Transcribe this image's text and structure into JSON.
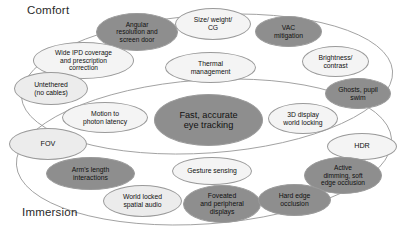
{
  "diagram": {
    "groups": [
      {
        "id": "comfort",
        "label": "Comfort"
      },
      {
        "id": "immersion",
        "label": "Immersion"
      }
    ],
    "colors": {
      "dark_fill": "#8e8e8e",
      "mid_fill": "#dcdcdc",
      "light_fill": "#ececec",
      "pale_fill": "#f4f4f4",
      "outline": "#9a9a9a",
      "text": "#111111",
      "background": "#ffffff"
    },
    "nodes": [
      {
        "id": "angular-resolution-and-screen-door",
        "label": "Angular resolution and screen door",
        "lines": [
          "Angular",
          "resolution and",
          "screen door"
        ],
        "group": "comfort",
        "shade": "dark",
        "x": 96,
        "y": 13,
        "w": 82,
        "h": 38,
        "font": 6.6
      },
      {
        "id": "size-weight-cg",
        "label": "Size/ weight/ CG",
        "lines": [
          "Size/ weight/",
          "CG"
        ],
        "group": "comfort",
        "shade": "pale",
        "x": 175,
        "y": 8,
        "w": 76,
        "h": 32,
        "font": 6.8
      },
      {
        "id": "vac-mitigation",
        "label": "VAC mitigation",
        "lines": [
          "VAC",
          "mitigation"
        ],
        "group": "comfort",
        "shade": "dark",
        "x": 255,
        "y": 16,
        "w": 67,
        "h": 31,
        "font": 6.8
      },
      {
        "id": "wide-ipd-coverage-and-prescription-correction",
        "label": "Wide IPD coverage and prescription correction",
        "lines": [
          "Wide IPD coverage",
          "and prescription",
          "correction"
        ],
        "group": "comfort",
        "shade": "pale",
        "x": 33,
        "y": 42,
        "w": 101,
        "h": 37,
        "font": 6.6
      },
      {
        "id": "thermal-management",
        "label": "Thermal management",
        "lines": [
          "Thermal",
          "management"
        ],
        "group": "comfort",
        "shade": "pale",
        "x": 165,
        "y": 52,
        "w": 91,
        "h": 31,
        "font": 6.8
      },
      {
        "id": "brightness-contrast",
        "label": "Brightness/ contrast",
        "lines": [
          "Brightness/",
          "contrast"
        ],
        "group": "comfort",
        "shade": "pale",
        "x": 302,
        "y": 46,
        "w": 67,
        "h": 31,
        "font": 6.8
      },
      {
        "id": "untethered-no-cables",
        "label": "Untethered (no cables)",
        "lines": [
          "Untethered",
          "(no cables)"
        ],
        "group": "comfort",
        "shade": "light",
        "x": 14,
        "y": 72,
        "w": 74,
        "h": 33,
        "font": 6.8
      },
      {
        "id": "ghosts-pupil-swim",
        "label": "Ghosts, pupil swim",
        "lines": [
          "Ghosts, pupil",
          "swim"
        ],
        "group": "comfort",
        "shade": "dark",
        "x": 325,
        "y": 78,
        "w": 66,
        "h": 31,
        "font": 6.8
      },
      {
        "id": "motion-to-photon-latency",
        "label": "Motion to photon latency",
        "lines": [
          "Motion to",
          "photon latency"
        ],
        "group": "overlap",
        "shade": "pale",
        "x": 62,
        "y": 102,
        "w": 86,
        "h": 31,
        "font": 6.8
      },
      {
        "id": "fast-accurate-eye-tracking",
        "label": "Fast, accurate eye tracking",
        "lines": [
          "Fast, accurate",
          "eye tracking"
        ],
        "group": "overlap",
        "shade": "dark",
        "x": 154,
        "y": 94,
        "w": 109,
        "h": 52,
        "font": 9.2
      },
      {
        "id": "3d-display-world-locking",
        "label": "3D display world locking",
        "lines": [
          "3D display",
          "world locking"
        ],
        "group": "overlap",
        "shade": "pale",
        "x": 268,
        "y": 103,
        "w": 70,
        "h": 31,
        "font": 6.8
      },
      {
        "id": "fov",
        "label": "FOV",
        "lines": [
          "FOV"
        ],
        "group": "immersion",
        "shade": "light",
        "x": 9,
        "y": 128,
        "w": 78,
        "h": 32,
        "font": 7.2
      },
      {
        "id": "hdr",
        "label": "HDR",
        "lines": [
          "HDR"
        ],
        "group": "immersion",
        "shade": "pale",
        "x": 327,
        "y": 133,
        "w": 70,
        "h": 27,
        "font": 7.2
      },
      {
        "id": "arms-length-interactions",
        "label": "Arm's length interactions",
        "lines": [
          "Arm's length",
          "interactions"
        ],
        "group": "immersion",
        "shade": "dark",
        "x": 46,
        "y": 157,
        "w": 89,
        "h": 33,
        "font": 6.8
      },
      {
        "id": "gesture-sensing",
        "label": "Gesture sensing",
        "lines": [
          "Gesture sensing"
        ],
        "group": "immersion",
        "shade": "pale",
        "x": 172,
        "y": 157,
        "w": 80,
        "h": 28,
        "font": 6.8
      },
      {
        "id": "active-dimming-soft-edge-occlusion",
        "label": "Active dimming, soft edge occlusion",
        "lines": [
          "Active",
          "dimming, soft",
          "edge occlusion"
        ],
        "group": "immersion",
        "shade": "dark",
        "x": 304,
        "y": 157,
        "w": 78,
        "h": 37,
        "font": 6.6
      },
      {
        "id": "world-locked-spatial-audio",
        "label": "World locked spatial audio",
        "lines": [
          "World locked",
          "spatial audio"
        ],
        "group": "immersion",
        "shade": "light",
        "x": 103,
        "y": 185,
        "w": 79,
        "h": 32,
        "font": 6.8
      },
      {
        "id": "foveated-and-peripheral-displays",
        "label": "Foveated and peripheral displays",
        "lines": [
          "Foveated",
          "and peripheral",
          "displays"
        ],
        "group": "immersion",
        "shade": "dark",
        "x": 183,
        "y": 185,
        "w": 78,
        "h": 38,
        "font": 6.8
      },
      {
        "id": "hard-edge-occlusion",
        "label": "Hard edge occlusion",
        "lines": [
          "Hard edge",
          "occlusion"
        ],
        "group": "immersion",
        "shade": "dark",
        "x": 258,
        "y": 184,
        "w": 73,
        "h": 32,
        "font": 6.8
      }
    ]
  }
}
